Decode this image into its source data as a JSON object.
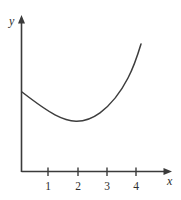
{
  "figure": {
    "name": "function-graph",
    "background_color": "#ffffff",
    "line_color": "#3b3b3b",
    "width": 181,
    "height": 200
  },
  "axes": {
    "y_axis": {
      "label": "y",
      "icon": "axis-arrow-up-icon"
    },
    "x_axis": {
      "label": "x",
      "icon": "axis-arrow-right-icon"
    },
    "x_ticks": [
      {
        "label": "1",
        "value": 1,
        "px": 48
      },
      {
        "label": "2",
        "value": 2,
        "px": 78
      },
      {
        "label": "3",
        "value": 3,
        "px": 107
      },
      {
        "label": "4",
        "value": 4,
        "px": 136
      }
    ],
    "y_ticks": []
  },
  "chart_data": {
    "type": "line",
    "title": "",
    "subtitle": "",
    "xlabel": "x",
    "ylabel": "y",
    "xlim": [
      0,
      5.15
    ],
    "ylim": [
      0,
      5.3
    ],
    "grid": false,
    "legend": null,
    "annotations": [],
    "series": [
      {
        "name": "curve",
        "color": "#3d3d3d",
        "x": [
          0.0,
          0.25,
          0.5,
          0.75,
          1.0,
          1.25,
          1.5,
          1.75,
          2.0,
          2.25,
          2.5,
          2.75,
          3.0,
          3.25,
          3.5,
          3.75,
          4.0
        ],
        "y": [
          2.73,
          2.52,
          2.33,
          2.18,
          2.05,
          1.95,
          1.89,
          1.86,
          1.87,
          1.94,
          2.07,
          2.27,
          2.55,
          2.93,
          3.4,
          3.98,
          4.37
        ]
      }
    ],
    "curve_path": "M 22,92 C 33,100.5 44,109 55,114.8 C 63,119 70,121 76,121.2 C 84,121.4 92,118.6 100,112.8 C 110,105.4 120,93.5 128,78 C 134,66.5 138,54 141,44",
    "features": {
      "y_intercept_px": 92,
      "minimum_px": {
        "x": 76,
        "y": 121
      },
      "right_end_px": {
        "x": 141,
        "y": 44
      },
      "minimum_value": {
        "x": 1.85,
        "y": 1.86
      }
    }
  }
}
